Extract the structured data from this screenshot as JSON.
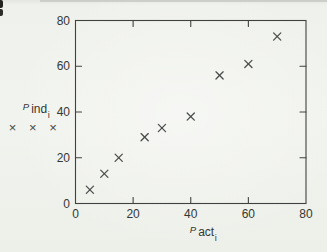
{
  "page": {
    "kind": "scanned textbook scatter plot"
  },
  "colors": {
    "paper": "#eff1ec",
    "ink": "#3f423f",
    "text": "#343734",
    "marker": "#474b48"
  },
  "chart_data": {
    "type": "scatter",
    "marker_glyph": "x",
    "series": [
      {
        "name": "Pind vs Pact",
        "x": [
          5,
          10,
          15,
          24,
          30,
          40,
          50,
          60,
          70
        ],
        "y": [
          6,
          13,
          20,
          29,
          33,
          38,
          56,
          61,
          73
        ]
      }
    ],
    "x_title": {
      "prefix": "P",
      "name": "act",
      "subscript": "i"
    },
    "y_title": {
      "prefix": "P",
      "name": "ind",
      "subscript": "i"
    },
    "legend_markers": "× × ×",
    "xlim": [
      0,
      80
    ],
    "ylim": [
      0,
      80
    ],
    "xticks": [
      0,
      20,
      40,
      60,
      80
    ],
    "yticks": [
      0,
      20,
      40,
      60,
      80
    ],
    "grid": false,
    "frame": true,
    "tick_style": "inward, mirrored on all four sides",
    "legend_position": "left of plot, under y-axis title",
    "layout": {
      "left": 75.5,
      "top": 20.5,
      "right": 306,
      "bottom": 203.5,
      "tick_len": 6,
      "tick_label_size": 12
    }
  }
}
